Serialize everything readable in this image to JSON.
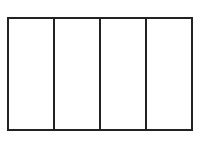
{
  "diagram": {
    "type": "rectangle-divided-into-columns",
    "columns": 4,
    "rows": 1,
    "stroke_color": "#222222",
    "fill_color": "#ffffff",
    "cells": [
      {
        "label": ""
      },
      {
        "label": ""
      },
      {
        "label": ""
      },
      {
        "label": ""
      }
    ]
  }
}
